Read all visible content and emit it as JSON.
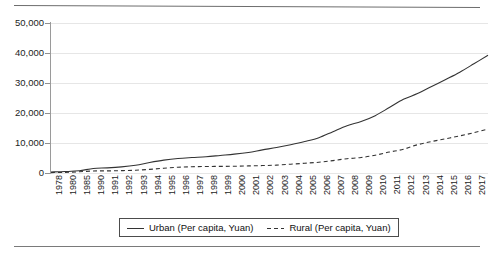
{
  "chart_data": {
    "type": "line",
    "title": "",
    "subtitle": "",
    "xlabel": "",
    "ylabel": "",
    "ylim": [
      0,
      50000
    ],
    "y_ticks": [
      0,
      10000,
      20000,
      30000,
      40000,
      50000
    ],
    "y_tick_labels": [
      "0",
      "10,000",
      "20,000",
      "30,000",
      "40,000",
      "50,000"
    ],
    "grid": true,
    "legend_position": "bottom-center",
    "categories": [
      "1978",
      "1980",
      "1985",
      "1990",
      "1991",
      "1992",
      "1993",
      "1994",
      "1995",
      "1996",
      "1997",
      "1998",
      "1999",
      "2000",
      "2001",
      "2002",
      "2003",
      "2004",
      "2005",
      "2006",
      "2007",
      "2008",
      "2009",
      "2010",
      "2011",
      "2012",
      "2013",
      "2014",
      "2015",
      "2016",
      "2017",
      "2018"
    ],
    "series": [
      {
        "name": "Urban (Per capita, Yuan)",
        "style": "solid",
        "color": "#333333",
        "values": [
          343,
          478,
          739,
          1510,
          1701,
          2027,
          2577,
          3496,
          4283,
          4839,
          5160,
          5425,
          5854,
          6280,
          6860,
          7703,
          8472,
          9422,
          10493,
          11760,
          13786,
          15781,
          17175,
          19109,
          21810,
          24565,
          26467,
          28844,
          31195,
          33616,
          36396,
          39251
        ]
      },
      {
        "name": "Rural (Per capita, Yuan)",
        "style": "dashed",
        "color": "#333333",
        "values": [
          134,
          191,
          398,
          686,
          709,
          784,
          922,
          1221,
          1578,
          1926,
          2090,
          2162,
          2210,
          2253,
          2366,
          2476,
          2622,
          2936,
          3255,
          3587,
          4140,
          4761,
          5153,
          5919,
          6977,
          7917,
          9430,
          10489,
          11422,
          12363,
          13432,
          14617
        ]
      }
    ]
  },
  "legend": {
    "entries": [
      {
        "label": "Urban (Per capita, Yuan)",
        "style": "solid"
      },
      {
        "label": "Rural (Per capita, Yuan)",
        "style": "dashed"
      }
    ]
  }
}
